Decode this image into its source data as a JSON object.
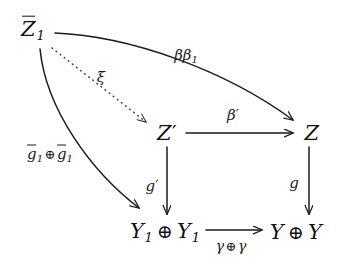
{
  "diagram": {
    "type": "commutative-diagram",
    "background_color": "#ffffff",
    "stroke_color": "#1a1a1a",
    "nodes": [
      {
        "id": "zbar1",
        "label": "Z̄1",
        "plain": "Z̄1",
        "x": 33,
        "y": 30
      },
      {
        "id": "zprime",
        "label": "Z′",
        "plain": "Z'",
        "x": 167,
        "y": 133
      },
      {
        "id": "z",
        "label": "Z",
        "plain": "Z",
        "x": 312,
        "y": 133
      },
      {
        "id": "y1y1",
        "label": "Y1 ⊕ Y1",
        "plain": "Y1 + Y1",
        "x": 165,
        "y": 232
      },
      {
        "id": "yy",
        "label": "Y ⊕ Y",
        "plain": "Y + Y",
        "x": 296,
        "y": 232
      }
    ],
    "edges": [
      {
        "id": "bb1",
        "from": "zbar1",
        "to": "z",
        "label": "ββ₁",
        "plain": "beta beta_1",
        "style": "solid",
        "shape": "curve",
        "label_x": 186,
        "label_y": 56
      },
      {
        "id": "xi",
        "from": "zbar1",
        "to": "zprime",
        "label": "ξ",
        "plain": "xi",
        "style": "dotted",
        "shape": "straight",
        "label_x": 101,
        "label_y": 77
      },
      {
        "id": "bprime",
        "from": "zprime",
        "to": "z",
        "label": "β′",
        "plain": "beta'",
        "style": "solid",
        "shape": "straight",
        "label_x": 233,
        "label_y": 115
      },
      {
        "id": "gbar",
        "from": "zbar1",
        "to": "y1y1",
        "label": "ḡ1 ⊕ ḡ1",
        "plain": "gbar_1 + gbar_1",
        "style": "solid",
        "shape": "curve",
        "label_x": 50,
        "label_y": 155
      },
      {
        "id": "gprime",
        "from": "zprime",
        "to": "y1y1",
        "label": "g′",
        "plain": "g'",
        "style": "solid",
        "shape": "straight",
        "label_x": 152,
        "label_y": 186
      },
      {
        "id": "g",
        "from": "z",
        "to": "yy",
        "label": "g",
        "plain": "g",
        "style": "solid",
        "shape": "straight",
        "label_x": 294,
        "label_y": 183
      },
      {
        "id": "gamma",
        "from": "y1y1",
        "to": "yy",
        "label": "γ ⊕ γ",
        "plain": "gamma + gamma",
        "style": "solid",
        "shape": "straight",
        "label_x": 231,
        "label_y": 246
      }
    ]
  }
}
